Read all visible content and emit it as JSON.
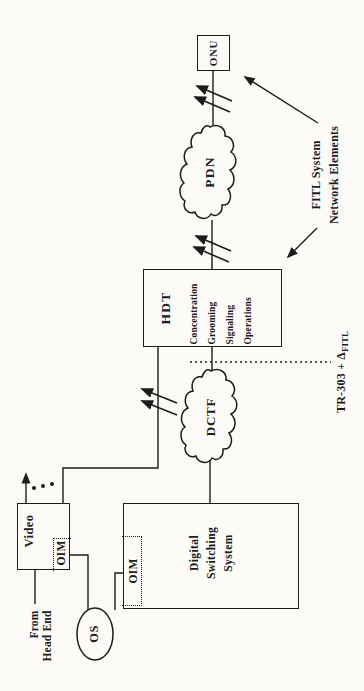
{
  "figure": {
    "background": "#fcfbf8",
    "ink": "#1c1c1c"
  },
  "nodes": {
    "onu": {
      "label": "ONU"
    },
    "pdn": {
      "label": "PDN"
    },
    "dctf": {
      "label": "DCTF"
    },
    "hdt": {
      "label": "HDT",
      "functions": [
        "Concentration",
        "Grooming",
        "Signaling",
        "Operations"
      ]
    },
    "dss": {
      "lines": [
        "Digital",
        "Switching",
        "System"
      ]
    },
    "video": {
      "label": "Video"
    },
    "video_oim": {
      "label": "OIM"
    },
    "dss_oim": {
      "label": "OIM"
    },
    "os": {
      "label": "OS"
    }
  },
  "annotations": {
    "from_head_end": {
      "lines": [
        "From",
        "Head End"
      ]
    },
    "fitl_system": {
      "lines": [
        "FITL System",
        "Network Elements"
      ]
    },
    "tr303": {
      "main": "TR-303 + Δ",
      "subscript": "FITL"
    }
  }
}
